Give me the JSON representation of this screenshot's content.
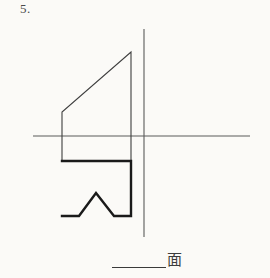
{
  "page": {
    "background_color": "#fbfaf7",
    "width": 270,
    "height": 278
  },
  "problem": {
    "number_label": "5."
  },
  "caption": {
    "blank_line": "",
    "label": "面"
  },
  "drawing": {
    "title": "orthographic-projection-exercise",
    "line_color_thin": "#5a5a5a",
    "line_color_thick": "#1a1a1a",
    "axes": {
      "vertical": {
        "x": 144,
        "y1": 29,
        "y2": 237,
        "width": 1
      },
      "horizontal": {
        "y": 136,
        "x1": 33,
        "x2": 250,
        "width": 1
      }
    },
    "upper_view": {
      "name": "front-view-outline",
      "points": "62,161 62,112 131,52 131,161",
      "stroke_width": 1.1
    },
    "lower_view": {
      "name": "top-view-outline",
      "points": "62,161 131,161 131,216 114,216 96,193 79,216 62,216",
      "stroke_width": 2.4
    }
  }
}
